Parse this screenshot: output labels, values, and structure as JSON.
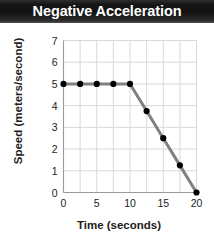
{
  "title": "Negative Acceleration",
  "axes": {
    "xlabel": "Time (seconds)",
    "ylabel": "Speed (meters/second)"
  },
  "colors": {
    "title_bar_dark": "#101010",
    "title_text": "#ffffff",
    "line": "#808080",
    "marker": "#000000",
    "grid": "#d8d8d8",
    "axis": "#9a9a9a",
    "text": "#1c1c1c",
    "background": "#ffffff"
  },
  "chart_data": {
    "type": "line",
    "title": "Negative Acceleration",
    "xlabel": "Time (seconds)",
    "ylabel": "Speed (meters/second)",
    "xlim": [
      0,
      20
    ],
    "ylim": [
      0,
      7
    ],
    "xticks": [
      0,
      5,
      10,
      15,
      20
    ],
    "xtick_labels": [
      "0",
      "5",
      "10",
      "15",
      "20"
    ],
    "x_minor_step": 2.5,
    "yticks": [
      0,
      1,
      2,
      3,
      4,
      5,
      6,
      7
    ],
    "ytick_labels": [
      "0",
      "1",
      "2",
      "3",
      "4",
      "5",
      "6",
      "7"
    ],
    "grid": true,
    "legend": "none",
    "series": [
      {
        "name": "Speed",
        "marker": "circle",
        "x": [
          0,
          2.5,
          5,
          7.5,
          10,
          12.5,
          15,
          17.5,
          20
        ],
        "y": [
          5,
          5,
          5,
          5,
          5,
          3.75,
          2.5,
          1.25,
          0
        ]
      }
    ]
  }
}
